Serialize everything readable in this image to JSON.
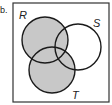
{
  "diagram": {
    "type": "venn",
    "item_marker": "b.",
    "sets": [
      {
        "label": "R",
        "cx": 45,
        "cy": 40,
        "r": 23
      },
      {
        "label": "S",
        "cx": 78,
        "cy": 47,
        "r": 23
      },
      {
        "label": "T",
        "cx": 52,
        "cy": 70,
        "r": 23
      }
    ],
    "shaded_region": "R ∪ T",
    "colors": {
      "shade": "#c8c8c8",
      "stroke": "#1a1a1a",
      "background": "#ffffff"
    }
  }
}
